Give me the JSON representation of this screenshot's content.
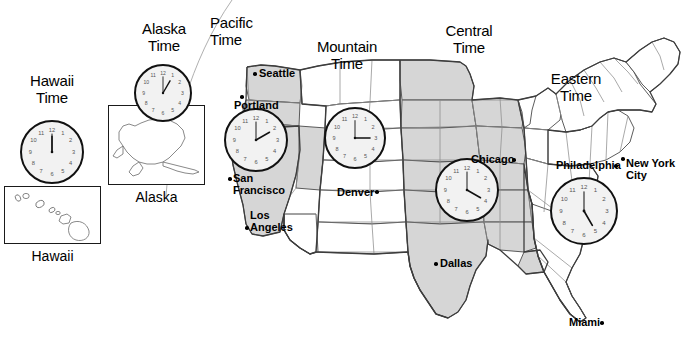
{
  "zones": [
    {
      "name": "hawaii",
      "label": "Hawaii\nTime",
      "clock_time": "12:00",
      "hour": 12,
      "minute": 0
    },
    {
      "name": "alaska",
      "label": "Alaska\nTime",
      "clock_time": "1:00",
      "hour": 1,
      "minute": 0
    },
    {
      "name": "pacific",
      "label": "Pacific\nTime",
      "clock_time": "2:00",
      "hour": 2,
      "minute": 0
    },
    {
      "name": "mountain",
      "label": "Mountain\nTime",
      "clock_time": "3:00",
      "hour": 3,
      "minute": 0
    },
    {
      "name": "central",
      "label": "Central\nTime",
      "clock_time": "4:00",
      "hour": 4,
      "minute": 0
    },
    {
      "name": "eastern",
      "label": "Eastern\nTime",
      "clock_time": "5:00",
      "hour": 5,
      "minute": 0
    }
  ],
  "insets": [
    {
      "name": "hawaii",
      "caption": "Hawaii"
    },
    {
      "name": "alaska",
      "caption": "Alaska"
    }
  ],
  "cities": [
    {
      "name": "seattle",
      "label": "Seattle"
    },
    {
      "name": "portland",
      "label": "Portland"
    },
    {
      "name": "san-francisco",
      "label": "San\nFrancisco"
    },
    {
      "name": "los-angeles",
      "label": "Los\nAngeles"
    },
    {
      "name": "denver",
      "label": "Denver"
    },
    {
      "name": "dallas",
      "label": "Dallas"
    },
    {
      "name": "chicago",
      "label": "Chicago"
    },
    {
      "name": "philadelphia",
      "label": "Philadelphia"
    },
    {
      "name": "new-york-city",
      "label": "New York City"
    },
    {
      "name": "miami",
      "label": "Miami"
    }
  ],
  "clock_numerals": [
    "12",
    "1",
    "2",
    "3",
    "4",
    "5",
    "6",
    "7",
    "8",
    "9",
    "10",
    "11"
  ],
  "colors": {
    "shaded_zone": "#d6d6d6",
    "unshaded_zone": "#ffffff",
    "outline": "#4a4a4a",
    "state_line": "#8c8c8c",
    "text": "#000000",
    "clock_face": "#f2f2f2",
    "clock_rim": "#111111"
  }
}
